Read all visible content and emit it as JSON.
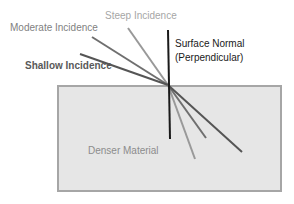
{
  "labels": {
    "steep": "Steep Incidence",
    "moderate": "Moderate Incidence",
    "shallow": "Shallow Incidence",
    "normal_line1": "Surface Normal",
    "normal_line2": "(Perpendicular)",
    "material": "Denser Material"
  },
  "colors": {
    "material_fill": "#e6e6e6",
    "material_border": "#a6a6a6",
    "normal": "#1a1a1a",
    "steep": "#999999",
    "moderate": "#6f6f6f",
    "shallow": "#555555",
    "steep_text": "#a6a6a6",
    "moderate_text": "#7f7f7f",
    "shallow_text": "#595959",
    "normal_text": "#1a1a1a",
    "material_text": "#8c8c8c"
  }
}
